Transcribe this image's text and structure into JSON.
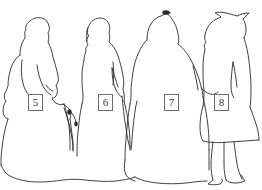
{
  "image": {
    "kind": "line-drawing",
    "subject": "four standing figures in long period dresses, outline tracing",
    "background_color": "#ffffff",
    "stroke_color": "#2b2b2b",
    "width": 262,
    "height": 190
  },
  "annotations": {
    "box_border_color": "#6b6b6b",
    "box_fill_color": "#ffffff",
    "box_text_color": "#3a3a3a",
    "labels": [
      {
        "id": "label-5",
        "text": "5",
        "x": 28,
        "y": 94,
        "refers_to": "figure-1"
      },
      {
        "id": "label-6",
        "text": "6",
        "x": 98,
        "y": 94,
        "refers_to": "figure-2"
      },
      {
        "id": "label-7",
        "text": "7",
        "x": 164,
        "y": 94,
        "refers_to": "figure-3"
      },
      {
        "id": "label-8",
        "text": "8",
        "x": 214,
        "y": 94,
        "refers_to": "figure-4"
      }
    ]
  },
  "figures": [
    {
      "id": "figure-1",
      "label": "5",
      "description": "leftmost figure, front-facing, long hair or bonnet, wide floor-length skirt, arm at side",
      "head_top_y": 18
    },
    {
      "id": "figure-2",
      "label": "6",
      "description": "second figure, left profile, narrow bodice, bent arm, long skirt",
      "head_top_y": 14
    },
    {
      "id": "figure-3",
      "label": "7",
      "description": "third figure, dark ornament on top of head, broad shoulders, very wide skirt",
      "head_top_y": 10
    },
    {
      "id": "figure-4",
      "label": "8",
      "description": "rightmost figure, wide brimmed hat, shorter skirt with legs and shoes visible",
      "head_top_y": 8
    }
  ],
  "details": [
    {
      "id": "umbrella",
      "description": "closed parasol hanging between figure 1 and figure 2"
    },
    {
      "id": "hemline",
      "description": "wavy ground-level hemline running across the bottom of the drawing"
    }
  ]
}
